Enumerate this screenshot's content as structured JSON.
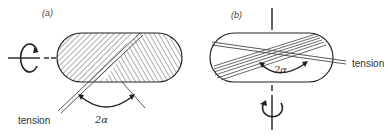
{
  "figure": {
    "panels": [
      {
        "id": "a",
        "label": "(a)",
        "axis_orientation": "horizontal",
        "tension_label": "tension",
        "angle_label": "2α",
        "description": "Filament wound horizontally-rotating cylinder with helical hatch at two opposing angles"
      },
      {
        "id": "b",
        "label": "(b)",
        "axis_orientation": "vertical",
        "tension_label": "tension",
        "angle_label": "2α",
        "description": "Filament wound vertically-rotating cylinder with crossing bands of fibre"
      }
    ],
    "colors": {
      "line": "#222222",
      "background": "#ffffff"
    }
  }
}
